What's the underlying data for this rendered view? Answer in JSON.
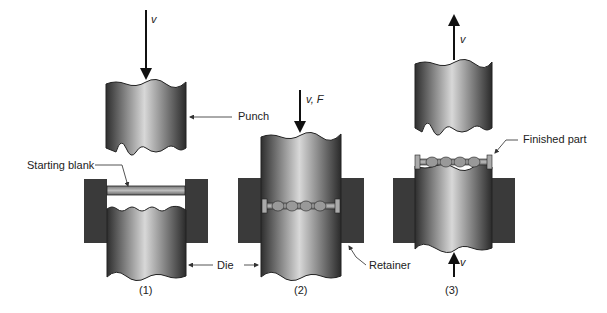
{
  "diagram": {
    "type": "process-sequence",
    "steps": [
      {
        "label": "(1)",
        "arrow": {
          "direction": "down",
          "label": "v"
        },
        "callouts": [
          "Punch",
          "Starting blank",
          "Die"
        ]
      },
      {
        "label": "(2)",
        "arrow": {
          "direction": "down",
          "label": "v, F"
        },
        "callouts": [
          "Retainer"
        ]
      },
      {
        "label": "(3)",
        "arrows": [
          {
            "direction": "up",
            "label": "v",
            "position": "top"
          },
          {
            "direction": "up",
            "label": "v",
            "position": "bottom"
          }
        ],
        "callouts": [
          "Finished part"
        ]
      }
    ]
  },
  "labels": {
    "v1": "v",
    "punch": "Punch",
    "starting_blank": "Starting blank",
    "die": "Die",
    "step1": "(1)",
    "vF": "v, F",
    "retainer": "Retainer",
    "step2": "(2)",
    "v3_top": "v",
    "finished_part": "Finished part",
    "v3_bottom": "v",
    "step3": "(3)"
  },
  "colors": {
    "retainer": "#3a3a3a",
    "metal_dark": "#2e2e2e",
    "metal_light": "#d8d8d8",
    "blank": "#9a9a9a",
    "line": "#111111",
    "leader": "#555555"
  }
}
